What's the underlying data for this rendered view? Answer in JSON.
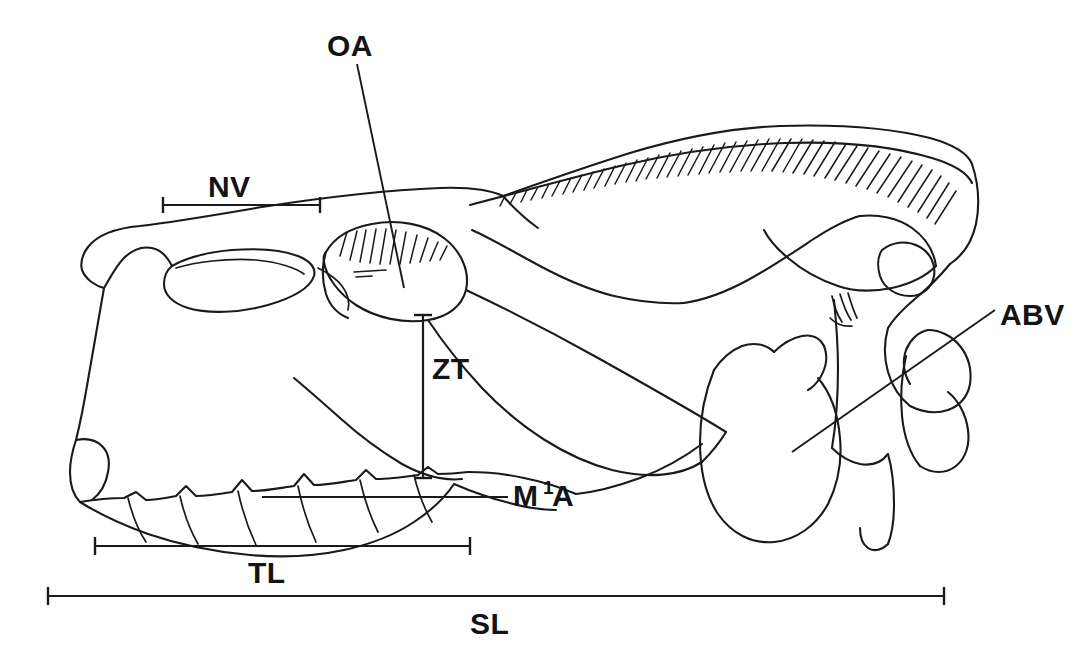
{
  "figure": {
    "kind": "skull-lateral-measurement-diagram",
    "background_color": "#ffffff",
    "ink_color": "#1a1a1a"
  },
  "labels": {
    "oa": {
      "text": "OA",
      "meaning": "orbit axis",
      "x": 327,
      "y": 56
    },
    "nv": {
      "text": "NV",
      "meaning": "nasal vacuity length",
      "x": 208,
      "y": 197
    },
    "zt": {
      "text": "ZT",
      "meaning": "zygomatic to tooth row depth",
      "x": 432,
      "y": 379
    },
    "m1a_main": {
      "text": "M",
      "meaning": "first molar anterior",
      "x": 513,
      "y": 506
    },
    "m1a_sup": {
      "text": "1",
      "x": 543,
      "y": 494
    },
    "m1a_tail": {
      "text": "A",
      "x": 552,
      "y": 506
    },
    "abv": {
      "text": "ABV",
      "meaning": "auditory bulla ventral",
      "x": 1000,
      "y": 325
    },
    "tl": {
      "text": "TL",
      "meaning": "tooth row length",
      "x": 248,
      "y": 583
    },
    "sl": {
      "text": "SL",
      "meaning": "skull length",
      "x": 470,
      "y": 634
    }
  },
  "measurements": {
    "nv_bar": {
      "x1": 163,
      "x2": 320,
      "y": 205
    },
    "zt_bar": {
      "x": 423,
      "y1": 315,
      "y2": 478
    },
    "tl_bar": {
      "x1": 95,
      "x2": 470,
      "y": 546
    },
    "sl_bar": {
      "x1": 48,
      "x2": 944,
      "y": 596
    }
  },
  "leaders": {
    "oa_line": {
      "x1": 357,
      "y1": 64,
      "x2": 404,
      "y2": 288
    },
    "m1a_line": {
      "x1": 262,
      "y1": 497,
      "x2": 508,
      "y2": 497
    },
    "abv_line": {
      "x1": 995,
      "y1": 310,
      "x2": 792,
      "y2": 452
    }
  }
}
